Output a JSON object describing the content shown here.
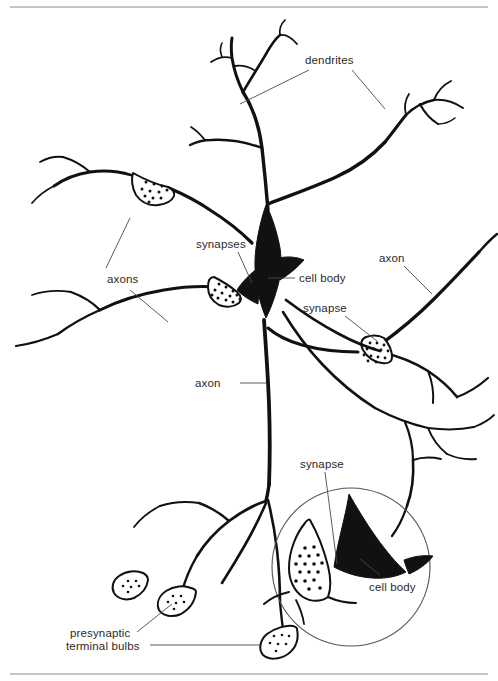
{
  "figure": {
    "background_color": "#ffffff",
    "ink_color": "#111111",
    "leader_color": "#4a4a4a",
    "frame_color": "#8b8b8b",
    "width": 498,
    "height": 681
  },
  "labels": {
    "dendrites": "dendrites",
    "synapses": "synapses",
    "axons": "axons",
    "cell_body_main": "cell body",
    "synapse_right": "synapse",
    "axon_right": "axon",
    "axon_middle": "axon",
    "synapse_inset": "synapse",
    "cell_body_inset": "cell body",
    "presynaptic_line1": "presynaptic",
    "presynaptic_line2": "terminal bulbs"
  },
  "structures": [
    {
      "name": "cell-body-central",
      "type": "soma",
      "description": "Dark triangular soma of the central neuron"
    },
    {
      "name": "cell-body-inset",
      "type": "soma",
      "description": "Dark soma shown inside the magnified circle"
    },
    {
      "name": "terminal-bulb-upper-left",
      "type": "presynaptic-bulb",
      "vesicles": 11
    },
    {
      "name": "terminal-bulb-left-soma",
      "type": "presynaptic-bulb",
      "vesicles": 14
    },
    {
      "name": "terminal-bulb-right",
      "type": "presynaptic-bulb",
      "vesicles": 13
    },
    {
      "name": "terminal-bulb-lower-left",
      "type": "presynaptic-bulb",
      "vesicles": 6
    },
    {
      "name": "terminal-bulb-lower-middle",
      "type": "presynaptic-bulb",
      "vesicles": 6
    },
    {
      "name": "terminal-bulb-lower-right",
      "type": "presynaptic-bulb",
      "vesicles": 7
    },
    {
      "name": "terminal-bulb-inset",
      "type": "presynaptic-bulb",
      "vesicles": 17
    },
    {
      "name": "magnification-circle",
      "type": "inset-circle",
      "center_x": 351,
      "center_y": 567,
      "radius": 79
    }
  ]
}
